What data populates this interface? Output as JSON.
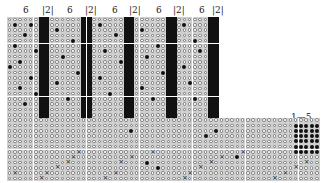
{
  "diagram": {
    "type": "stitch-chart",
    "cell_size": 5.3,
    "origin": {
      "x": 7,
      "y": 17
    },
    "rows": 31,
    "upper_columns": 40,
    "full_columns": 59,
    "lower_start_row": 19,
    "repeat": {
      "open": 6,
      "solid": 2,
      "count": 5
    },
    "labels": {
      "open_count": "6",
      "solid_count": "|2|",
      "range": "1—5"
    },
    "legend_symbols": {
      "o": "open-circle",
      "s": "solid-square",
      "d": "filled-dot",
      "x": "cross"
    },
    "scattered_dots_upper": [
      [
        1,
        1
      ],
      [
        1,
        4
      ],
      [
        3,
        3
      ],
      [
        5,
        1
      ],
      [
        6,
        5
      ],
      [
        8,
        2
      ],
      [
        9,
        0
      ],
      [
        11,
        4
      ],
      [
        13,
        2
      ],
      [
        14,
        5
      ],
      [
        16,
        3
      ],
      [
        2,
        9
      ],
      [
        4,
        12
      ],
      [
        7,
        10
      ],
      [
        10,
        13
      ],
      [
        12,
        9
      ],
      [
        15,
        11
      ],
      [
        1,
        17
      ],
      [
        3,
        20
      ],
      [
        6,
        18
      ],
      [
        8,
        21
      ],
      [
        11,
        17
      ],
      [
        14,
        19
      ],
      [
        2,
        25
      ],
      [
        5,
        28
      ],
      [
        7,
        26
      ],
      [
        10,
        29
      ],
      [
        13,
        25
      ],
      [
        15,
        27
      ],
      [
        1,
        33
      ],
      [
        4,
        35
      ],
      [
        6,
        36
      ],
      [
        9,
        33
      ],
      [
        12,
        34
      ],
      [
        15,
        35
      ]
    ],
    "dots_lower": [
      [
        21,
        23
      ],
      [
        27,
        26
      ],
      [
        28,
        28
      ],
      [
        26,
        43
      ],
      [
        25,
        44
      ],
      [
        21,
        39
      ],
      [
        22,
        37
      ]
    ],
    "crosses_lower": [
      [
        30,
        6
      ],
      [
        29,
        7
      ],
      [
        28,
        9
      ],
      [
        27,
        11
      ],
      [
        26,
        12
      ],
      [
        25,
        13
      ],
      [
        30,
        18
      ],
      [
        29,
        20
      ],
      [
        27,
        21
      ],
      [
        26,
        23
      ],
      [
        25,
        27
      ],
      [
        30,
        33
      ],
      [
        29,
        34
      ],
      [
        28,
        36
      ],
      [
        27,
        38
      ],
      [
        26,
        40
      ],
      [
        25,
        44
      ],
      [
        30,
        50
      ],
      [
        29,
        52
      ],
      [
        28,
        54
      ],
      [
        27,
        56
      ],
      [
        29,
        1
      ]
    ],
    "dot_block": {
      "row_start": 20,
      "row_end": 25,
      "col_start": 54,
      "col_end": 58
    }
  }
}
